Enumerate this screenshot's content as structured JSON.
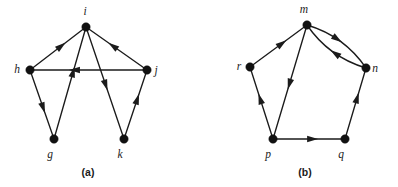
{
  "figure": {
    "background_color": "#ffffff",
    "ink_color": "#1b1b1b",
    "width": 398,
    "height": 187,
    "panels": [
      {
        "id": "a",
        "caption": "(a)",
        "caption_x": 88,
        "caption_y": 176,
        "vertices": [
          {
            "id": "i",
            "label": "i",
            "x": 86,
            "y": 27,
            "r": 4.2,
            "label_x": 85,
            "label_y": 15
          },
          {
            "id": "h",
            "label": "h",
            "x": 30,
            "y": 70,
            "r": 4.2,
            "label_x": 17,
            "label_y": 73
          },
          {
            "id": "j",
            "label": "j",
            "x": 147,
            "y": 70,
            "r": 4.2,
            "label_x": 156,
            "label_y": 74
          },
          {
            "id": "g",
            "label": "g",
            "x": 54,
            "y": 139,
            "r": 4.2,
            "label_x": 50,
            "label_y": 158
          },
          {
            "id": "k",
            "label": "k",
            "x": 124,
            "y": 139,
            "r": 4.2,
            "label_x": 120,
            "label_y": 158
          }
        ],
        "edges": [
          {
            "from": "h",
            "to": "i",
            "kind": "straight",
            "arrow_t": 0.56
          },
          {
            "from": "j",
            "to": "i",
            "kind": "straight",
            "arrow_t": 0.56
          },
          {
            "from": "j",
            "to": "h",
            "kind": "straight",
            "arrow_t": 0.62
          },
          {
            "from": "h",
            "to": "g",
            "kind": "straight",
            "arrow_t": 0.55
          },
          {
            "from": "g",
            "to": "i",
            "kind": "straight",
            "arrow_t": 0.6
          },
          {
            "from": "i",
            "to": "k",
            "kind": "straight",
            "arrow_t": 0.52
          },
          {
            "from": "k",
            "to": "j",
            "kind": "straight",
            "arrow_t": 0.58
          }
        ]
      },
      {
        "id": "b",
        "caption": "(b)",
        "caption_x": 305,
        "caption_y": 176,
        "vertices": [
          {
            "id": "m",
            "label": "m",
            "x": 307,
            "y": 25,
            "r": 4.2,
            "label_x": 304,
            "label_y": 13
          },
          {
            "id": "r",
            "label": "r",
            "x": 250,
            "y": 67,
            "r": 4.2,
            "label_x": 239,
            "label_y": 70
          },
          {
            "id": "n",
            "label": "n",
            "x": 366,
            "y": 68,
            "r": 4.2,
            "label_x": 375,
            "label_y": 72
          },
          {
            "id": "p",
            "label": "p",
            "x": 273,
            "y": 139,
            "r": 4.2,
            "label_x": 268,
            "label_y": 158
          },
          {
            "id": "q",
            "label": "q",
            "x": 345,
            "y": 139,
            "r": 4.2,
            "label_x": 341,
            "label_y": 158
          }
        ],
        "edges": [
          {
            "from": "r",
            "to": "m",
            "kind": "straight",
            "arrow_t": 0.56
          },
          {
            "from": "p",
            "to": "r",
            "kind": "straight",
            "arrow_t": 0.56
          },
          {
            "from": "m",
            "to": "p",
            "kind": "straight",
            "arrow_t": 0.52
          },
          {
            "from": "m",
            "to": "n",
            "kind": "curve",
            "bulge": -13,
            "arrow_t": 0.45
          },
          {
            "from": "n",
            "to": "m",
            "kind": "curve",
            "bulge": -13,
            "arrow_t": 0.46
          },
          {
            "from": "p",
            "to": "q",
            "kind": "straight",
            "arrow_t": 0.55
          },
          {
            "from": "q",
            "to": "n",
            "kind": "straight",
            "arrow_t": 0.58
          }
        ]
      }
    ]
  }
}
